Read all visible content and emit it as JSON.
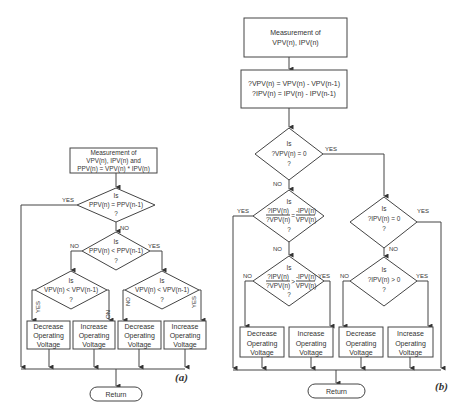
{
  "diagram_a": {
    "caption": "(a)",
    "measurement": [
      "Measurement of",
      "VPV(n), IPV(n) and",
      "PPV(n) = VPV(n) * IPV(n)"
    ],
    "decision1": {
      "top": "Is",
      "cond": "PPV(n) = PPV(n-1)",
      "q": "?",
      "yes": "YES",
      "no": "NO"
    },
    "decision2": {
      "top": "Is",
      "cond": "PPV(n) < PPV(n-1)",
      "q": "?",
      "yes": "YES",
      "no": "NO"
    },
    "decision3": {
      "top": "Is",
      "cond": "VPV(n) < VPV(n-1)",
      "q": "?",
      "yes": "YES",
      "no": "NO"
    },
    "decision4": {
      "top": "Is",
      "cond": "VPV(n) < VPV(n-1)",
      "q": "?",
      "yes": "YES",
      "no": "NO"
    },
    "actions": [
      [
        "Decrease",
        "Operating",
        "Voltage"
      ],
      [
        "Increase",
        "Operating",
        "Voltage"
      ],
      [
        "Decrease",
        "Operating",
        "Voltage"
      ],
      [
        "Increase",
        "Operating",
        "Voltage"
      ]
    ],
    "return": "Return"
  },
  "diagram_b": {
    "caption": "(b)",
    "measurement": [
      "Measurement of",
      "VPV(n), IPV(n)"
    ],
    "deltas": [
      "?VPV(n) = VPV(n) - VPV(n-1)",
      "?IPV(n) = IPV(n) - IPV(n-1)"
    ],
    "decision1": {
      "top": "Is",
      "cond": "?VPV(n) = 0",
      "q": "?",
      "yes": "YES",
      "no": "NO"
    },
    "decision2": {
      "top": "Is",
      "cond_num_l": "?IPV(n)",
      "cond_den_l": "?VPV(n)",
      "op": "=",
      "cond_num_r": "-IPV(n)",
      "cond_den_r": "VPV(n)",
      "q": "?",
      "yes": "YES",
      "no": "NO"
    },
    "decision3": {
      "top": "Is",
      "cond_num_l": "?IPV(n)",
      "cond_den_l": "?VPV(n)",
      "op": ">",
      "cond_num_r": "-IPV(n)",
      "cond_den_r": "VPV(n)",
      "q": "?",
      "yes": "YES",
      "no": "NO"
    },
    "decision4": {
      "top": "Is",
      "cond": "?IPV(n) = 0",
      "q": "?",
      "yes": "YES",
      "no": "NO"
    },
    "decision5": {
      "top": "Is",
      "cond": "?IPV(n) > 0",
      "q": "?",
      "yes": "YES",
      "no": "NO"
    },
    "actions": [
      [
        "Decrease",
        "Operating",
        "Voltage"
      ],
      [
        "Increase",
        "Operating",
        "Voltage"
      ],
      [
        "Decrease",
        "Operating",
        "Voltage"
      ],
      [
        "Increase",
        "Operating",
        "Voltage"
      ]
    ],
    "return": "Return"
  }
}
